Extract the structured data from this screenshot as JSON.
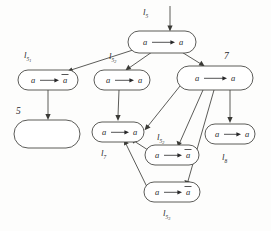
{
  "diagram": {
    "type": "directed-graph",
    "nodes": [
      {
        "id": "n-top",
        "label": "a → a",
        "lhs": "a",
        "rhs": "a",
        "rhs_negated": false,
        "tag": "l",
        "tag_sub": "5",
        "tag_subsub": "",
        "tag_position": "left",
        "empty": false,
        "cx": 162,
        "cy": 42,
        "rx": 34,
        "ry": 11
      },
      {
        "id": "n-l51",
        "label": "a → ā",
        "lhs": "a",
        "rhs": "a",
        "rhs_negated": true,
        "tag": "l",
        "tag_sub": "5",
        "tag_subsub": "1",
        "tag_position": "above-left",
        "empty": false,
        "cx": 48,
        "cy": 80,
        "rx": 30,
        "ry": 10
      },
      {
        "id": "n-l52",
        "label": "a → a",
        "lhs": "a",
        "rhs": "a",
        "rhs_negated": false,
        "tag": "l",
        "tag_sub": "5",
        "tag_subsub": "2",
        "tag_position": "above-left",
        "empty": false,
        "cx": 122,
        "cy": 80,
        "rx": 28,
        "ry": 10
      },
      {
        "id": "n-7",
        "label": "a → a",
        "lhs": "a",
        "rhs": "a",
        "rhs_negated": false,
        "tag": "7",
        "tag_sub": "",
        "tag_subsub": "",
        "tag_position": "above-right",
        "empty": false,
        "cx": 215,
        "cy": 78,
        "rx": 38,
        "ry": 12
      },
      {
        "id": "n-5",
        "label": "",
        "lhs": "",
        "rhs": "",
        "rhs_negated": false,
        "tag": "5",
        "tag_sub": "",
        "tag_subsub": "",
        "tag_position": "above-left",
        "empty": true,
        "cx": 47,
        "cy": 134,
        "rx": 33,
        "ry": 14
      },
      {
        "id": "n-l7",
        "label": "a → a",
        "lhs": "a",
        "rhs": "a",
        "rhs_negated": false,
        "tag": "l",
        "tag_sub": "7",
        "tag_subsub": "",
        "tag_position": "below-left",
        "empty": false,
        "cx": 118,
        "cy": 132,
        "rx": 26,
        "ry": 10
      },
      {
        "id": "n-l52b",
        "label": "a → ā",
        "lhs": "a",
        "rhs": "a",
        "rhs_negated": true,
        "tag": "l",
        "tag_sub": "5",
        "tag_subsub": "2",
        "tag_position": "above-left",
        "empty": false,
        "cx": 172,
        "cy": 155,
        "rx": 27,
        "ry": 10
      },
      {
        "id": "n-l8",
        "label": "a → a",
        "lhs": "a",
        "rhs": "a",
        "rhs_negated": false,
        "tag": "l",
        "tag_sub": "8",
        "tag_subsub": "",
        "tag_position": "below",
        "empty": false,
        "cx": 230,
        "cy": 134,
        "rx": 25,
        "ry": 10
      },
      {
        "id": "n-l53",
        "label": "a → ā",
        "lhs": "a",
        "rhs": "a",
        "rhs_negated": true,
        "tag": "l",
        "tag_sub": "5",
        "tag_subsub": "3",
        "tag_position": "below",
        "empty": false,
        "cx": 172,
        "cy": 192,
        "rx": 28,
        "ry": 10
      }
    ],
    "edges": [
      {
        "id": "e-entry",
        "from": "external",
        "to": "n-top",
        "kind": "entry"
      },
      {
        "id": "e-top-51",
        "from": "n-top",
        "to": "n-l51",
        "kind": "tree"
      },
      {
        "id": "e-top-52",
        "from": "n-top",
        "to": "n-l52",
        "kind": "tree"
      },
      {
        "id": "e-top-7",
        "from": "n-top",
        "to": "n-7",
        "kind": "tree"
      },
      {
        "id": "e-51-5",
        "from": "n-l51",
        "to": "n-5",
        "kind": "tree"
      },
      {
        "id": "e-52-l7",
        "from": "n-l52",
        "to": "n-l7",
        "kind": "tree"
      },
      {
        "id": "e-7-l7",
        "from": "n-7",
        "to": "n-l7",
        "kind": "cross"
      },
      {
        "id": "e-7-52b",
        "from": "n-7",
        "to": "n-l52b",
        "kind": "cross"
      },
      {
        "id": "e-7-53",
        "from": "n-7",
        "to": "n-l53",
        "kind": "cross"
      },
      {
        "id": "e-7-l8",
        "from": "n-7",
        "to": "n-l8",
        "kind": "tree"
      },
      {
        "id": "e-52b-l7",
        "from": "n-l52b",
        "to": "n-l7",
        "kind": "back"
      },
      {
        "id": "e-53-l7",
        "from": "n-l53",
        "to": "n-l7",
        "kind": "back"
      }
    ],
    "colors": {
      "stroke": "#4a4a46",
      "text": "#28282a",
      "background": "#fdfdfc"
    }
  }
}
